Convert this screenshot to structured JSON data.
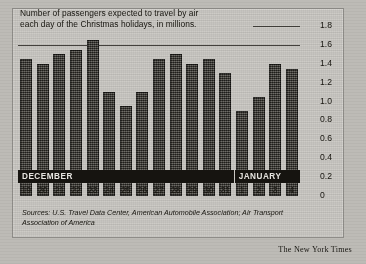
{
  "title": {
    "line1": "Number of passengers expected to travel by air",
    "line2": "each day of the Christmas holidays, in millions."
  },
  "source": {
    "line1": "Sources: U.S. Travel Data Center, American Automobile Association; Air Transport",
    "line2": "Association of America"
  },
  "credit": "The New York Times",
  "months": {
    "december": "DECEMBER",
    "january": "JANUARY"
  },
  "colors": {
    "bar": "#3a3730",
    "band": "#161410",
    "panel": "#cdcbc6",
    "ink": "#17150f"
  },
  "chart_data": {
    "type": "bar",
    "title": "Number of passengers expected to travel by air each day of the Christmas holidays, in millions.",
    "xlabel": "",
    "ylabel": "millions of passengers",
    "ylim": [
      0,
      1.8
    ],
    "yticks": [
      0,
      0.2,
      0.4,
      0.6,
      0.8,
      1.0,
      1.2,
      1.4,
      1.6,
      1.8
    ],
    "ytick_labels": [
      "0",
      "0.2",
      "0.4",
      "0.6",
      "0.8",
      "1.0",
      "1.2",
      "1.4",
      "1.6",
      "1.8"
    ],
    "grid": true,
    "gridlines": [
      1.8,
      1.6
    ],
    "legend": null,
    "categories": [
      "19",
      "20",
      "21",
      "22",
      "23",
      "24",
      "25",
      "26",
      "27",
      "28",
      "29",
      "30",
      "31",
      "1",
      "2",
      "3",
      "4"
    ],
    "group_labels": [
      {
        "label": "DECEMBER",
        "from": "19",
        "to": "31"
      },
      {
        "label": "JANUARY",
        "from": "1",
        "to": "4"
      }
    ],
    "values": [
      1.45,
      1.4,
      1.5,
      1.55,
      1.65,
      1.1,
      0.95,
      1.1,
      1.45,
      1.5,
      1.4,
      1.45,
      1.3,
      0.9,
      1.05,
      1.4,
      1.35
    ]
  }
}
